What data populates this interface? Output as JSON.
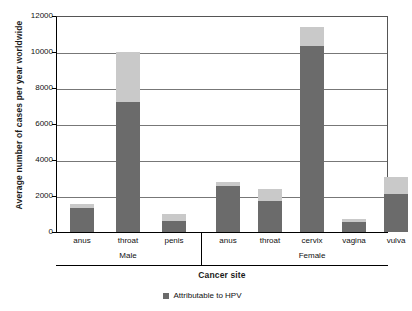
{
  "chart_data": {
    "type": "bar",
    "title": "",
    "subtitle": "",
    "xlabel": "Cancer site",
    "ylabel": "Average number of cases per year worldwide",
    "ylim": [
      0,
      12000
    ],
    "yticks": [
      0,
      2000,
      4000,
      6000,
      8000,
      10000,
      12000
    ],
    "ytick_labels": [
      "0",
      "2000",
      "4000",
      "6000",
      "8000",
      "10000",
      "12000"
    ],
    "grid": true,
    "stacked": true,
    "legend_position": "bottom",
    "legend": [
      "Attributable to HPV"
    ],
    "groups": [
      {
        "name": "Male",
        "categories": [
          "anus",
          "throat",
          "penis"
        ]
      },
      {
        "name": "Female",
        "categories": [
          "anus",
          "throat",
          "cervix",
          "vagina",
          "vulva"
        ]
      }
    ],
    "categories": [
      "anus",
      "throat",
      "penis",
      "anus",
      "throat",
      "cervix",
      "vagina",
      "vulva"
    ],
    "series": [
      {
        "name": "Attributable to HPV",
        "color": "#6b6b6b",
        "values": [
          1350,
          7200,
          600,
          2550,
          1700,
          10350,
          570,
          2100
        ]
      },
      {
        "name": "Not attributable to HPV",
        "color": "#c9c9c9",
        "values": [
          180,
          2800,
          400,
          250,
          700,
          1050,
          140,
          950
        ]
      }
    ],
    "totals": [
      1530,
      10000,
      1000,
      2800,
      2400,
      11400,
      710,
      3050
    ]
  },
  "legend": {
    "swatch_color": "#6b6b6b",
    "label": "Attributable to HPV"
  },
  "axes": {
    "y_title": "Average number of cases per year worldwide",
    "x_title": "Cancer site"
  }
}
